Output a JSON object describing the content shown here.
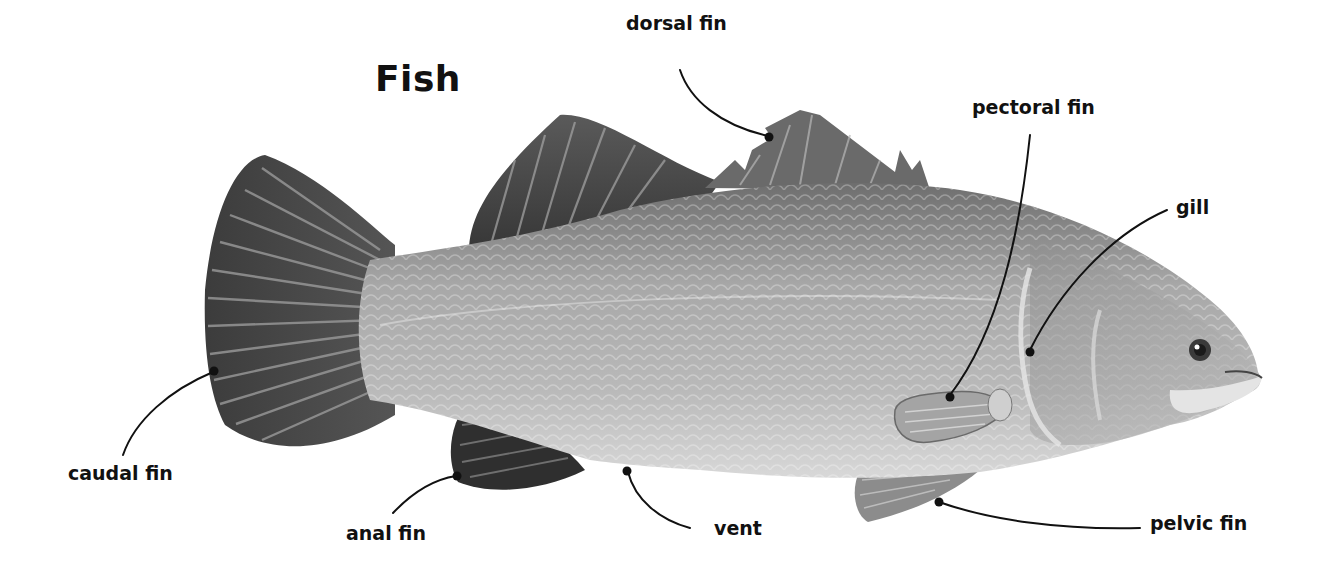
{
  "diagram": {
    "title": "Fish",
    "colors": {
      "text": "#111111",
      "leader_line": "#111111",
      "fins_dark": "#3a3a3a",
      "body": "#9a9a9a",
      "belly": "#d6d6d6",
      "background": "#ffffff"
    },
    "labels": [
      {
        "id": "dorsal-fin",
        "text": "dorsal fin",
        "points_to": "dorsal fin (spiny front part)"
      },
      {
        "id": "pectoral-fin",
        "text": "pectoral fin",
        "points_to": "pectoral fin behind gill"
      },
      {
        "id": "gill",
        "text": "gill",
        "points_to": "gill cover edge"
      },
      {
        "id": "caudal-fin",
        "text": "caudal fin",
        "points_to": "tail fin"
      },
      {
        "id": "anal-fin",
        "text": "anal fin",
        "points_to": "anal fin"
      },
      {
        "id": "vent",
        "text": "vent",
        "points_to": "vent opening on belly"
      },
      {
        "id": "pelvic-fin",
        "text": "pelvic fin",
        "points_to": "pelvic fin under body"
      }
    ]
  }
}
